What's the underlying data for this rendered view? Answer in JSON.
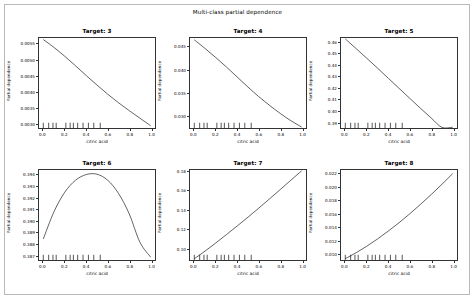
{
  "figure": {
    "title": "Multi-class partial dependence",
    "background": "#ffffff",
    "frame_color": "#b9b9b9",
    "line_color": "#1f1f1f",
    "width": 475,
    "height": 300
  },
  "chart_data": {
    "type": "line",
    "title": "Multi-class partial dependence",
    "xlabel": "citric acid",
    "ylabel": "Partial dependence",
    "grid": false,
    "legend": null,
    "layout": {
      "rows": 2,
      "cols": 3
    },
    "shared_x": {
      "ticks": [
        0.0,
        0.2,
        0.4,
        0.6,
        0.8,
        1.0
      ],
      "tick_labels": [
        "0.0",
        "0.2",
        "0.4",
        "0.6",
        "0.8",
        "1.0"
      ],
      "xlim": [
        -0.04,
        1.04
      ]
    },
    "deciles": [
      0.0,
      0.05,
      0.09,
      0.12,
      0.21,
      0.25,
      0.28,
      0.32,
      0.37,
      0.42,
      0.47,
      0.53
    ],
    "panels": [
      {
        "title": "Target: 3",
        "xlabel": "citric acid",
        "ylabel": "Partial dependence",
        "yticks": [
          0.003,
          0.0035,
          0.004,
          0.0045,
          0.005,
          0.0055
        ],
        "ytick_labels": [
          "0.0030",
          "0.0035",
          "0.0040",
          "0.0045",
          "0.0050",
          "0.0055"
        ],
        "ylim": [
          0.00285,
          0.0057
        ],
        "x": [
          0.0,
          0.1,
          0.2,
          0.3,
          0.4,
          0.5,
          0.6,
          0.7,
          0.8,
          0.9,
          1.0
        ],
        "y": [
          0.00565,
          0.0054,
          0.00512,
          0.00482,
          0.00451,
          0.00421,
          0.00392,
          0.00365,
          0.0034,
          0.00316,
          0.00292
        ]
      },
      {
        "title": "Target: 4",
        "xlabel": "citric acid",
        "ylabel": "Partial dependence",
        "yticks": [
          0.03,
          0.035,
          0.04,
          0.045
        ],
        "ytick_labels": [
          "0.030",
          "0.035",
          "0.040",
          "0.045"
        ],
        "ylim": [
          0.0272,
          0.047
        ],
        "x": [
          0.0,
          0.1,
          0.2,
          0.3,
          0.4,
          0.5,
          0.6,
          0.7,
          0.8,
          0.9,
          1.0
        ],
        "y": [
          0.0466,
          0.0447,
          0.0427,
          0.0406,
          0.0384,
          0.0362,
          0.0341,
          0.0322,
          0.0304,
          0.0288,
          0.0274
        ]
      },
      {
        "title": "Target: 5",
        "xlabel": "citric acid",
        "ylabel": "Partial dependence",
        "yticks": [
          0.39,
          0.4,
          0.41,
          0.42,
          0.43,
          0.44,
          0.45,
          0.46
        ],
        "ytick_labels": [
          "0.39",
          "0.40",
          "0.41",
          "0.42",
          "0.43",
          "0.44",
          "0.45",
          "0.46"
        ],
        "ylim": [
          0.3845,
          0.464
        ],
        "x": [
          0.0,
          0.1,
          0.2,
          0.3,
          0.4,
          0.5,
          0.6,
          0.7,
          0.8,
          0.9,
          1.0
        ],
        "y": [
          0.4632,
          0.4547,
          0.4461,
          0.4374,
          0.4285,
          0.4196,
          0.4107,
          0.4019,
          0.3933,
          0.385,
          0.3852
        ]
      },
      {
        "title": "Target: 6",
        "xlabel": "citric acid",
        "ylabel": "Partial dependence",
        "yticks": [
          0.387,
          0.388,
          0.389,
          0.39,
          0.391,
          0.392,
          0.393,
          0.394
        ],
        "ytick_labels": [
          "0.387",
          "0.388",
          "0.389",
          "0.390",
          "0.391",
          "0.392",
          "0.393",
          "0.394"
        ],
        "ylim": [
          0.38655,
          0.39445
        ],
        "x": [
          0.0,
          0.1,
          0.2,
          0.3,
          0.4,
          0.5,
          0.6,
          0.7,
          0.8,
          0.9,
          1.0
        ],
        "y": [
          0.3884,
          0.3908,
          0.3925,
          0.39355,
          0.39405,
          0.39408,
          0.39355,
          0.3924,
          0.3906,
          0.3881,
          0.3868
        ]
      },
      {
        "title": "Target: 7",
        "xlabel": "citric acid",
        "ylabel": "Partial dependence",
        "yticks": [
          0.1,
          0.12,
          0.14,
          0.16,
          0.18
        ],
        "ytick_labels": [
          "0.10",
          "0.12",
          "0.14",
          "0.16",
          "0.18"
        ],
        "ylim": [
          0.0875,
          0.1818
        ],
        "x": [
          0.0,
          0.1,
          0.2,
          0.3,
          0.4,
          0.5,
          0.6,
          0.7,
          0.8,
          0.9,
          1.0
        ],
        "y": [
          0.0888,
          0.0968,
          0.1053,
          0.1142,
          0.1232,
          0.1324,
          0.1418,
          0.1515,
          0.1613,
          0.1712,
          0.181
        ]
      },
      {
        "title": "Target: 8",
        "xlabel": "citric acid",
        "ylabel": "Partial dependence",
        "yticks": [
          0.01,
          0.012,
          0.014,
          0.016,
          0.018,
          0.02,
          0.022
        ],
        "ytick_labels": [
          "0.010",
          "0.012",
          "0.014",
          "0.016",
          "0.018",
          "0.020",
          "0.022"
        ],
        "ylim": [
          0.00895,
          0.02265
        ],
        "x": [
          0.0,
          0.1,
          0.2,
          0.3,
          0.4,
          0.5,
          0.6,
          0.7,
          0.8,
          0.9,
          1.0
        ],
        "y": [
          0.00915,
          0.01005,
          0.01105,
          0.01215,
          0.01335,
          0.01462,
          0.01598,
          0.01742,
          0.01892,
          0.02048,
          0.0221
        ]
      }
    ]
  }
}
